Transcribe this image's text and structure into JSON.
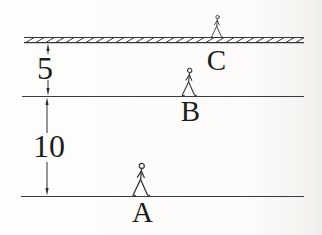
{
  "diagram": {
    "kind": "levels-diagram",
    "colors": {
      "background": "#fcfbf9",
      "line": "#3a3a3a",
      "text": "#1d1d1d",
      "figure": "#3a3a3a"
    },
    "dimensions": {
      "upper_gap_label": "5",
      "lower_gap_label": "10"
    },
    "positions": {
      "top_label": "C",
      "middle_label": "B",
      "bottom_label": "A"
    },
    "icons": [
      {
        "name": "walking-person-icon",
        "on_level": "C"
      },
      {
        "name": "walking-person-icon",
        "on_level": "B"
      },
      {
        "name": "walking-person-icon",
        "on_level": "A"
      }
    ]
  }
}
